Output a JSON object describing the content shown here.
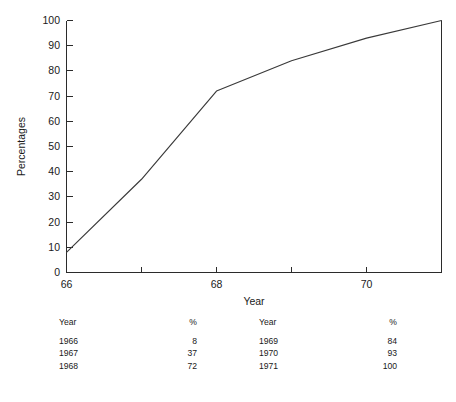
{
  "chart_data": {
    "type": "line",
    "title": "",
    "xlabel": "Year",
    "ylabel": "Percentages",
    "x": [
      66,
      67,
      68,
      69,
      70,
      71
    ],
    "values": [
      8,
      37,
      72,
      84,
      93,
      100
    ],
    "categories": [
      "1966",
      "1967",
      "1968",
      "1969",
      "1970",
      "1971"
    ],
    "xlim": [
      66,
      71
    ],
    "ylim": [
      0,
      100
    ],
    "xticks": [
      66,
      67,
      68,
      69,
      70,
      71
    ],
    "xtick_labels": [
      "66",
      "",
      "68",
      "",
      "70",
      ""
    ],
    "yticks": [
      0,
      10,
      20,
      30,
      40,
      50,
      60,
      70,
      80,
      90,
      100
    ],
    "ytick_labels": [
      "0",
      "10",
      "20",
      "30",
      "40",
      "50",
      "60",
      "70",
      "80",
      "90",
      "100"
    ],
    "grid": false,
    "legend": false,
    "line_color": "#3a3a3a",
    "axis_color": "#2b2b2b"
  },
  "table": {
    "headers_left": {
      "year": "Year",
      "pct": "%"
    },
    "headers_right": {
      "year": "Year",
      "pct": "%"
    },
    "rows": [
      {
        "year_left": "1966",
        "pct_left": "8",
        "year_right": "1969",
        "pct_right": "84"
      },
      {
        "year_left": "1967",
        "pct_left": "37",
        "year_right": "1970",
        "pct_right": "93"
      },
      {
        "year_left": "1968",
        "pct_left": "72",
        "year_right": "1971",
        "pct_right": "100"
      }
    ]
  },
  "caption": {
    "text": ""
  }
}
